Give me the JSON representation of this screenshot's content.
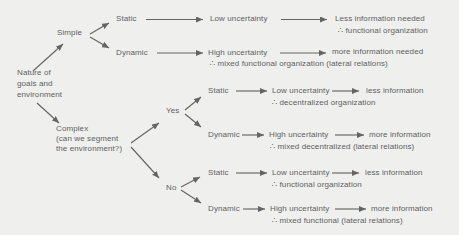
{
  "colors": {
    "background": "#eff0ee",
    "ink": "#5e5e5e",
    "arrow": "#646464"
  },
  "diagram": {
    "root_label": "Nature of\ngoals and\nenvironment",
    "level1": {
      "simple": "Simple",
      "complex": "Complex\n(can we segment\nthe environment?)"
    },
    "segment": {
      "yes": "Yes",
      "no": "No"
    },
    "branches": [
      {
        "condition": "Static",
        "uncertainty": "Low uncertainty",
        "outcome": "Less information needed",
        "conclusion": "∴ functional organization"
      },
      {
        "condition": "Dynamic",
        "uncertainty": "High uncertainty",
        "outcome": "more information needed",
        "conclusion": "∴ mixed functional organization (lateral relations)"
      },
      {
        "condition": "Static",
        "uncertainty": "Low uncertainty",
        "outcome": "less information",
        "conclusion": "∴ decentralized organization"
      },
      {
        "condition": "Dynamic",
        "uncertainty": "High uncertainty",
        "outcome": "more information",
        "conclusion": "∴ mixed decentralized (lateral relations)"
      },
      {
        "condition": "Static",
        "uncertainty": "Low uncertainty",
        "outcome": "less information",
        "conclusion": "∴ functional organization"
      },
      {
        "condition": "Dynamic",
        "uncertainty": "High uncertainty",
        "outcome": "more information",
        "conclusion": "∴ mixed functional (lateral relations)"
      }
    ]
  }
}
